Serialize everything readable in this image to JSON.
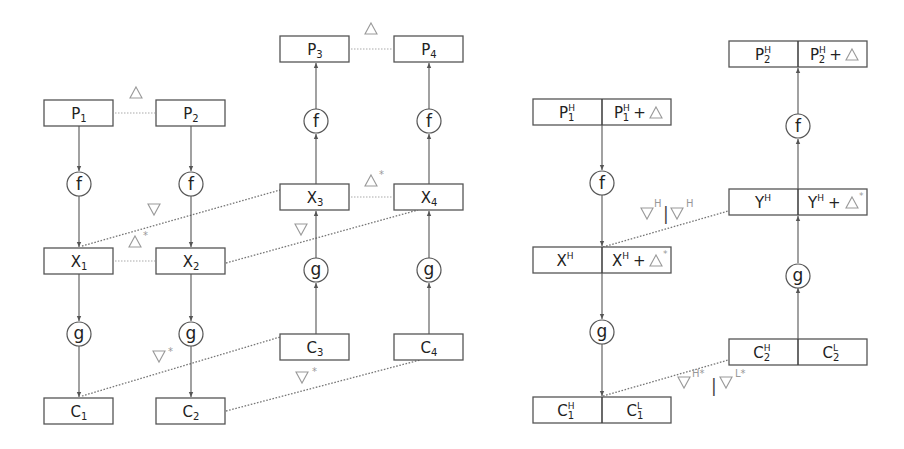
{
  "diagram": {
    "left": {
      "nodes": {
        "P1": {
          "base": "P",
          "sub": "1"
        },
        "P2": {
          "base": "P",
          "sub": "2"
        },
        "P3": {
          "base": "P",
          "sub": "3"
        },
        "P4": {
          "base": "P",
          "sub": "4"
        },
        "X1": {
          "base": "X",
          "sub": "1"
        },
        "X2": {
          "base": "X",
          "sub": "2"
        },
        "X3": {
          "base": "X",
          "sub": "3"
        },
        "X4": {
          "base": "X",
          "sub": "4"
        },
        "C1": {
          "base": "C",
          "sub": "1"
        },
        "C2": {
          "base": "C",
          "sub": "2"
        },
        "C3": {
          "base": "C",
          "sub": "3"
        },
        "C4": {
          "base": "C",
          "sub": "4"
        }
      },
      "functions": {
        "f": "f",
        "g": "g"
      },
      "labels": {
        "delta": "Δ",
        "delta_star": "Δ*",
        "nabla": "∇",
        "nabla_star": "∇*",
        "star": "*"
      },
      "edges": [
        {
          "from": "P1",
          "to": "X1",
          "via": "f",
          "direction": "down"
        },
        {
          "from": "P2",
          "to": "X2",
          "via": "f",
          "direction": "down"
        },
        {
          "from": "X1",
          "to": "C1",
          "via": "g",
          "direction": "down"
        },
        {
          "from": "X2",
          "to": "C2",
          "via": "g",
          "direction": "down"
        },
        {
          "from": "X3",
          "to": "P3",
          "via": "f",
          "direction": "up"
        },
        {
          "from": "X4",
          "to": "P4",
          "via": "f",
          "direction": "up"
        },
        {
          "from": "C3",
          "to": "X3",
          "via": "g",
          "direction": "up"
        },
        {
          "from": "C4",
          "to": "X4",
          "via": "g",
          "direction": "up"
        }
      ],
      "relations": [
        {
          "between": [
            "P1",
            "P2"
          ],
          "label": "Δ"
        },
        {
          "between": [
            "P3",
            "P4"
          ],
          "label": "Δ"
        },
        {
          "between": [
            "X1",
            "X2"
          ],
          "label": "Δ*"
        },
        {
          "between": [
            "X3",
            "X4"
          ],
          "label": "Δ*"
        },
        {
          "between": [
            "X1",
            "X3"
          ],
          "label": "∇"
        },
        {
          "between": [
            "X2",
            "X4"
          ],
          "label": "∇"
        },
        {
          "between": [
            "C1",
            "C3"
          ],
          "label": "∇*"
        },
        {
          "between": [
            "C2",
            "C4"
          ],
          "label": "∇*"
        }
      ]
    },
    "right": {
      "nodes": {
        "P1H": {
          "left": {
            "base": "P",
            "sub": "1",
            "sup": "H"
          },
          "right": {
            "base": "P",
            "sub": "1",
            "sup": "H",
            "suffix": "+Δ"
          }
        },
        "P2H": {
          "left": {
            "base": "P",
            "sub": "2",
            "sup": "H"
          },
          "right": {
            "base": "P",
            "sub": "2",
            "sup": "H",
            "suffix": "+Δ"
          }
        },
        "XH": {
          "left": {
            "base": "X",
            "sup": "H"
          },
          "right": {
            "base": "X",
            "sup": "H",
            "suffix": "+Δ*"
          }
        },
        "YH": {
          "left": {
            "base": "Y",
            "sup": "H"
          },
          "right": {
            "base": "Y",
            "sup": "H",
            "suffix": "+Δ*"
          }
        },
        "C1": {
          "left": {
            "base": "C",
            "sub": "1",
            "sup": "H"
          },
          "right": {
            "base": "C",
            "sub": "1",
            "sup": "L"
          }
        },
        "C2": {
          "left": {
            "base": "C",
            "sub": "2",
            "sup": "H"
          },
          "right": {
            "base": "C",
            "sub": "2",
            "sup": "L"
          }
        }
      },
      "labels": {
        "nabla_h_pair": "∇H|∇H",
        "nabla_hl_star_pair": "∇H*|∇L*",
        "H": "H",
        "L": "L",
        "H_star": "H*",
        "L_star": "L*",
        "bar": "|",
        "plus": "+",
        "star": "*"
      },
      "relations": [
        {
          "between": [
            "XH",
            "YH"
          ],
          "label": "∇H|∇H"
        },
        {
          "between": [
            "C1",
            "C2"
          ],
          "label": "∇H*|∇L*"
        }
      ]
    }
  }
}
